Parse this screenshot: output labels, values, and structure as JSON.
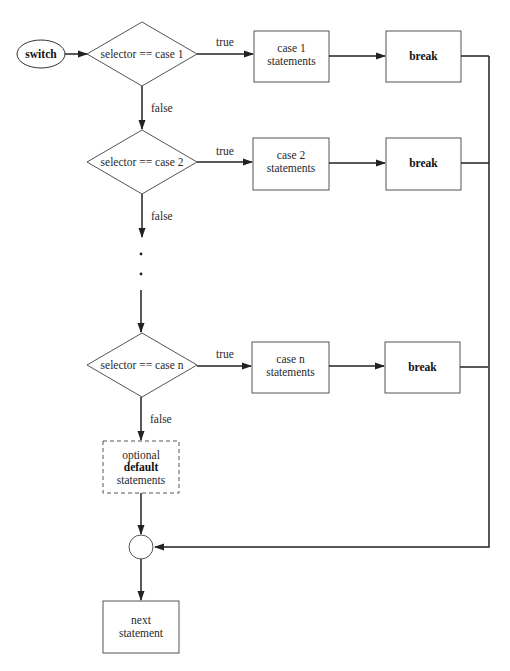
{
  "diagram": {
    "type": "flowchart",
    "start": {
      "label": "switch"
    },
    "cases": [
      {
        "condition": "selector == case 1",
        "true_label": "true",
        "false_label": "false",
        "statements_line1": "case 1",
        "statements_line2": "statements",
        "break_label": "break"
      },
      {
        "condition": "selector == case 2",
        "true_label": "true",
        "false_label": "false",
        "statements_line1": "case 2",
        "statements_line2": "statements",
        "break_label": "break"
      },
      {
        "condition": "selector == case n",
        "true_label": "true",
        "false_label": "false",
        "statements_line1": "case n",
        "statements_line2": "statements",
        "break_label": "break"
      }
    ],
    "ellipsis": ".",
    "default": {
      "line1": "optional",
      "line2": "default",
      "line3": "statements"
    },
    "end": {
      "line1": "next",
      "line2": "statement"
    },
    "colors": {
      "stroke": "#555555",
      "connector": "#222222",
      "text": "#2a2a2a",
      "background": "#ffffff"
    }
  }
}
